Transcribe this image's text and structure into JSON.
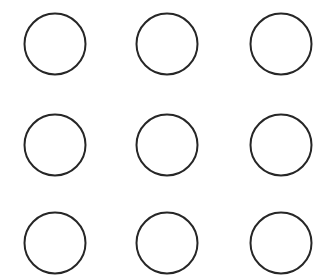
{
  "canvas": {
    "width": 322,
    "height": 280,
    "background_color": "#ffffff",
    "name": "circle-grid"
  },
  "style": {
    "stroke_color": "#262626",
    "stroke_width": 2,
    "fill": "none",
    "radius": 30.5
  },
  "grid": {
    "rows": 3,
    "columns": 3,
    "count": 9,
    "column_centers_x": [
      55,
      167,
      281
    ],
    "row_centers_y": [
      44,
      145,
      243
    ]
  },
  "shapes": [
    {
      "id": "circle-r1-c1",
      "row": 1,
      "column": 1,
      "cx": 55,
      "cy": 44,
      "r": 30.5
    },
    {
      "id": "circle-r1-c2",
      "row": 1,
      "column": 2,
      "cx": 167,
      "cy": 44,
      "r": 30.5
    },
    {
      "id": "circle-r1-c3",
      "row": 1,
      "column": 3,
      "cx": 281,
      "cy": 44,
      "r": 30.5
    },
    {
      "id": "circle-r2-c1",
      "row": 2,
      "column": 1,
      "cx": 55,
      "cy": 145,
      "r": 30.5
    },
    {
      "id": "circle-r2-c2",
      "row": 2,
      "column": 2,
      "cx": 167,
      "cy": 145,
      "r": 30.5
    },
    {
      "id": "circle-r2-c3",
      "row": 2,
      "column": 3,
      "cx": 281,
      "cy": 145,
      "r": 30.5
    },
    {
      "id": "circle-r3-c1",
      "row": 3,
      "column": 1,
      "cx": 55,
      "cy": 243,
      "r": 30.5
    },
    {
      "id": "circle-r3-c2",
      "row": 3,
      "column": 2,
      "cx": 167,
      "cy": 243,
      "r": 30.5
    },
    {
      "id": "circle-r3-c3",
      "row": 3,
      "column": 3,
      "cx": 281,
      "cy": 243,
      "r": 30.5
    }
  ]
}
